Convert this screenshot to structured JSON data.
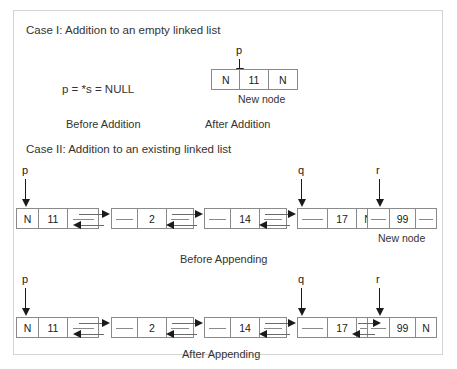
{
  "diagram": {
    "background": "#ffffff",
    "frame_color": "#d4d4d4",
    "node_border": "#8a8a8a",
    "shadow_color": "#bdbdbd",
    "arrow_color": "#1a1a1a"
  },
  "case1": {
    "heading": "Case I: Addition to an empty linked list",
    "expression": "p = *s = NULL",
    "before_caption": "Before Addition",
    "after_caption": "After Addition",
    "new_node_label": "New node",
    "pointer": "p",
    "node": {
      "prev": "N",
      "data": "11",
      "next": "N"
    }
  },
  "case2": {
    "heading": "Case II: Addition to an existing linked list",
    "before_caption": "Before Appending",
    "after_caption": "After Appending",
    "new_node_label": "New node",
    "pointers": {
      "p": "p",
      "q": "q",
      "r": "r"
    },
    "before": {
      "nodes": [
        {
          "prev": "N",
          "data": "11",
          "next": ""
        },
        {
          "prev": "",
          "data": "2",
          "next": ""
        },
        {
          "prev": "",
          "data": "14",
          "next": ""
        },
        {
          "prev": "",
          "data": "17",
          "next": "N"
        },
        {
          "prev": "",
          "data": "99",
          "next": ""
        }
      ]
    },
    "after": {
      "nodes": [
        {
          "prev": "N",
          "data": "11",
          "next": ""
        },
        {
          "prev": "",
          "data": "2",
          "next": ""
        },
        {
          "prev": "",
          "data": "14",
          "next": ""
        },
        {
          "prev": "",
          "data": "17",
          "next": ""
        },
        {
          "prev": "",
          "data": "99",
          "next": "N"
        }
      ]
    }
  }
}
